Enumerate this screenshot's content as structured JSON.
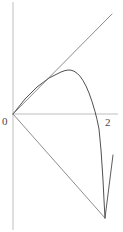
{
  "figure": {
    "width": 123,
    "height": 232,
    "background": "#ffffff"
  },
  "axes": {
    "axis_color": "#bfbfbf",
    "x_axis": {
      "x1": 13,
      "y1": 114,
      "x2": 118,
      "y2": 114
    },
    "y_axis": {
      "x1": 13,
      "y1": 2,
      "x2": 13,
      "y2": 230
    },
    "tick_labels": [
      {
        "name": "origin",
        "text": "0",
        "x": 5,
        "y": 122
      },
      {
        "name": "x-two",
        "text": "2",
        "x": 108,
        "y": 124
      }
    ]
  },
  "chart_data": {
    "type": "line",
    "title": "",
    "subtitle": "",
    "xlabel": "",
    "ylabel": "",
    "xlim": [
      0,
      2.4
    ],
    "ylim": [
      -2.4,
      2.6
    ],
    "grid": false,
    "legend": null,
    "axis_origin_px": {
      "x": 13,
      "y": 114
    },
    "px_per_unit_x": 46,
    "px_per_unit_y": 46,
    "xticks": [
      0,
      2
    ],
    "xticklabels": [
      "0",
      "2"
    ],
    "yticks": [],
    "yticklabels": [],
    "curve_color": "#3c3c3c",
    "series": [
      {
        "name": "curve",
        "kind": "curve",
        "color": "#3c3c3c",
        "width": 0.9,
        "points_px": [
          [
            13,
            114
          ],
          [
            17,
            109
          ],
          [
            21,
            104
          ],
          [
            25,
            99
          ],
          [
            29,
            95
          ],
          [
            33,
            91
          ],
          [
            37,
            87
          ],
          [
            41,
            84
          ],
          [
            45,
            81
          ],
          [
            49,
            78
          ],
          [
            53,
            76
          ],
          [
            57,
            74
          ],
          [
            61,
            72
          ],
          [
            65,
            70.6
          ],
          [
            68,
            70.0
          ],
          [
            71,
            70.2
          ],
          [
            74,
            71.2
          ],
          [
            77,
            73.2
          ],
          [
            80,
            76.2
          ],
          [
            83,
            80.5
          ],
          [
            86,
            86.0
          ],
          [
            89,
            93.0
          ],
          [
            92,
            101.5
          ],
          [
            95,
            111.5
          ],
          [
            97,
            119.5
          ],
          [
            99,
            129
          ],
          [
            101,
            150
          ],
          [
            103,
            180
          ],
          [
            104,
            200
          ],
          [
            105,
            218
          ]
        ]
      },
      {
        "name": "upper-tangent-line",
        "kind": "line",
        "color": "#6e6e6e",
        "width": 0.8,
        "points_px": [
          [
            13,
            114
          ],
          [
            112,
            14
          ]
        ]
      },
      {
        "name": "lower-secant-line",
        "kind": "line",
        "color": "#6e6e6e",
        "width": 0.8,
        "points_px": [
          [
            13,
            114
          ],
          [
            105,
            218
          ]
        ]
      },
      {
        "name": "right-steep-segment",
        "kind": "line",
        "color": "#4a4a4a",
        "width": 0.9,
        "points_px": [
          [
            113,
            155
          ],
          [
            105,
            218
          ]
        ]
      }
    ]
  }
}
